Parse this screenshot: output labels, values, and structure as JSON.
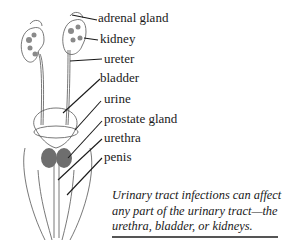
{
  "diagram": {
    "labels": [
      {
        "id": "adrenal-gland",
        "text": "adrenal gland",
        "x": 98,
        "y": 13
      },
      {
        "id": "kidney",
        "text": "kidney",
        "x": 100,
        "y": 33
      },
      {
        "id": "ureter",
        "text": "ureter",
        "x": 104,
        "y": 53
      },
      {
        "id": "bladder",
        "text": "bladder",
        "x": 100,
        "y": 72
      },
      {
        "id": "urine",
        "text": "urine",
        "x": 104,
        "y": 93
      },
      {
        "id": "prostate-gland",
        "text": "prostate gland",
        "x": 104,
        "y": 113
      },
      {
        "id": "urethra",
        "text": "urethra",
        "x": 104,
        "y": 132
      },
      {
        "id": "penis",
        "text": "penis",
        "x": 104,
        "y": 151
      }
    ],
    "caption": "Urinary tract infections can affect any part of the urinary tract—the urethra, bladder, or kidneys."
  }
}
